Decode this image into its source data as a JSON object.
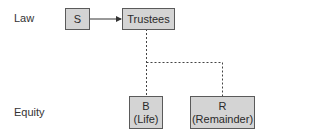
{
  "diagram": {
    "rows": {
      "law_label": "Law",
      "equity_label": "Equity"
    },
    "nodes": {
      "settlor": {
        "line1": "S"
      },
      "trustees": {
        "line1": "Trustees"
      },
      "beneficiary_life": {
        "line1": "B",
        "line2": "(Life)"
      },
      "remainder": {
        "line1": "R",
        "line2": "(Remainder)"
      }
    },
    "edges": [
      {
        "from": "S",
        "to": "Trustees",
        "style": "solid-arrow"
      },
      {
        "from": "Trustees",
        "to": "B (Life)",
        "style": "dashed"
      },
      {
        "from": "Trustees",
        "to": "R (Remainder)",
        "style": "dashed"
      }
    ],
    "colors": {
      "box_fill": "#d4d4d4",
      "box_border": "#5a5a5a",
      "line": "#333333"
    }
  }
}
